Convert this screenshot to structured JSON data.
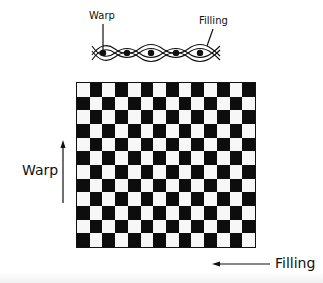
{
  "diagram": {
    "type": "plain-weave",
    "weave_labels": {
      "warp": "Warp",
      "filling": "Filling"
    },
    "axis_labels": {
      "warp": "Warp",
      "filling": "Filling"
    },
    "grid": {
      "columns": 14,
      "rows": 12,
      "top_left_color": "white",
      "pattern": "checkerboard"
    },
    "colors": {
      "ink": "#0d0d0d",
      "paper": "#ffffff",
      "light_cell": "#f7f7f7"
    },
    "weave_cross_section": {
      "warp_dots": 5
    }
  }
}
